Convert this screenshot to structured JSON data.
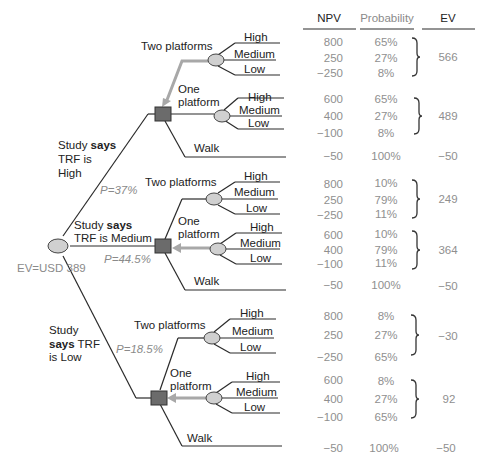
{
  "columns": {
    "npv": "NPV",
    "probability": "Probability",
    "ev": "EV"
  },
  "root": {
    "ev_label": "EV=USD 389"
  },
  "scenarios": [
    {
      "label_line1": "Study ",
      "label_bold": "says",
      "label_line2": "TRF is",
      "label_line3": "High",
      "probability": "P=37%",
      "options": [
        {
          "name": "Two platforms",
          "outcomes": [
            {
              "label": "High",
              "npv": "800",
              "prob": "65%"
            },
            {
              "label": "Medium",
              "npv": "250",
              "prob": "27%"
            },
            {
              "label": "Low",
              "npv": "−250",
              "prob": "8%"
            }
          ],
          "ev": "566"
        },
        {
          "name_line1": "One",
          "name_line2": "platform",
          "outcomes": [
            {
              "label": "High",
              "npv": "600",
              "prob": "65%"
            },
            {
              "label": "Medium",
              "npv": "400",
              "prob": "27%"
            },
            {
              "label": "Low",
              "npv": "−100",
              "prob": "8%"
            }
          ],
          "ev": "489"
        },
        {
          "name": "Walk",
          "npv": "−50",
          "prob": "100%",
          "ev": "−50"
        }
      ]
    },
    {
      "label_line1": "Study ",
      "label_bold": "says",
      "label_line2": "TRF is Medium",
      "probability": "P=44.5%",
      "options": [
        {
          "name": "Two platforms",
          "outcomes": [
            {
              "label": "High",
              "npv": "800",
              "prob": "10%"
            },
            {
              "label": "Medium",
              "npv": "250",
              "prob": "79%"
            },
            {
              "label": "Low",
              "npv": "−250",
              "prob": "11%"
            }
          ],
          "ev": "249"
        },
        {
          "name_line1": "One",
          "name_line2": "platform",
          "outcomes": [
            {
              "label": "High",
              "npv": "600",
              "prob": "10%"
            },
            {
              "label": "Medium",
              "npv": "400",
              "prob": "79%"
            },
            {
              "label": "Low",
              "npv": "−100",
              "prob": "11%"
            }
          ],
          "ev": "364"
        },
        {
          "name": "Walk",
          "npv": "−50",
          "prob": "100%",
          "ev": "−50"
        }
      ]
    },
    {
      "label_line1": "Study",
      "label_bold": "says",
      "label_line2_rest": " TRF",
      "label_line3": "is Low",
      "probability": "P=18.5%",
      "options": [
        {
          "name": "Two platforms",
          "outcomes": [
            {
              "label": "High",
              "npv": "800",
              "prob": "8%"
            },
            {
              "label": "Medium",
              "npv": "250",
              "prob": "27%"
            },
            {
              "label": "Low",
              "npv": "−250",
              "prob": "65%"
            }
          ],
          "ev": "−30"
        },
        {
          "name_line1": "One",
          "name_line2": "platform",
          "outcomes": [
            {
              "label": "High",
              "npv": "600",
              "prob": "8%"
            },
            {
              "label": "Medium",
              "npv": "400",
              "prob": "27%"
            },
            {
              "label": "Low",
              "npv": "−100",
              "prob": "65%"
            }
          ],
          "ev": "92"
        },
        {
          "name": "Walk",
          "npv": "−50",
          "prob": "100%",
          "ev": "−50"
        }
      ]
    }
  ],
  "colors": {
    "line": "#2a2a2a",
    "arrow": "#a8a8a8",
    "chance_fill": "#d0d0d0",
    "decision_fill": "#6b6b6b",
    "value_text": "#8f8f8f"
  }
}
